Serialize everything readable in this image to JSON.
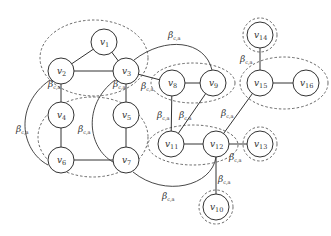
{
  "diagram": {
    "type": "graph",
    "node_prefix": "v",
    "nodes": [
      {
        "id": "v1",
        "sub": "1",
        "x": 104,
        "y": 42
      },
      {
        "id": "v2",
        "sub": "2",
        "x": 61,
        "y": 71
      },
      {
        "id": "v3",
        "sub": "3",
        "x": 126,
        "y": 71
      },
      {
        "id": "v4",
        "sub": "4",
        "x": 61,
        "y": 115
      },
      {
        "id": "v5",
        "sub": "5",
        "x": 126,
        "y": 115
      },
      {
        "id": "v6",
        "sub": "6",
        "x": 61,
        "y": 160
      },
      {
        "id": "v7",
        "sub": "7",
        "x": 126,
        "y": 160
      },
      {
        "id": "v8",
        "sub": "8",
        "x": 172,
        "y": 83
      },
      {
        "id": "v9",
        "sub": "9",
        "x": 213,
        "y": 83
      },
      {
        "id": "v10",
        "sub": "10",
        "x": 216,
        "y": 207
      },
      {
        "id": "v11",
        "sub": "11",
        "x": 171,
        "y": 144
      },
      {
        "id": "v12",
        "sub": "12",
        "x": 216,
        "y": 144
      },
      {
        "id": "v13",
        "sub": "13",
        "x": 260,
        "y": 144
      },
      {
        "id": "v14",
        "sub": "14",
        "x": 260,
        "y": 35
      },
      {
        "id": "v15",
        "sub": "15",
        "x": 260,
        "y": 83
      },
      {
        "id": "v16",
        "sub": "16",
        "x": 306,
        "y": 83
      }
    ],
    "edges": [
      [
        "v1",
        "v2"
      ],
      [
        "v1",
        "v3"
      ],
      [
        "v2",
        "v3"
      ],
      [
        "v2",
        "v4"
      ],
      [
        "v4",
        "v6"
      ],
      [
        "v6",
        "v7"
      ],
      [
        "v3",
        "v5"
      ],
      [
        "v5",
        "v7"
      ],
      [
        "v3",
        "v8"
      ],
      [
        "v8",
        "v9"
      ],
      [
        "v8",
        "v11"
      ],
      [
        "v9",
        "v11"
      ],
      [
        "v11",
        "v12"
      ],
      [
        "v12",
        "v13"
      ],
      [
        "v12",
        "v10"
      ],
      [
        "v12",
        "v15"
      ],
      [
        "v14",
        "v15"
      ],
      [
        "v15",
        "v16"
      ]
    ],
    "groups": [
      {
        "name": "v1-v2-v3 cluster",
        "members": [
          "v1",
          "v2",
          "v3"
        ]
      },
      {
        "name": "v4-v6-v7 cluster",
        "members": [
          "v4",
          "v6",
          "v7",
          "v5"
        ]
      },
      {
        "name": "v8-v9 cluster",
        "members": [
          "v8",
          "v9"
        ]
      },
      {
        "name": "v11-v12 cluster",
        "members": [
          "v11",
          "v12"
        ]
      },
      {
        "name": "v13 cluster",
        "members": [
          "v13"
        ]
      },
      {
        "name": "v10 cluster",
        "members": [
          "v10"
        ]
      },
      {
        "name": "v14 cluster",
        "members": [
          "v14"
        ]
      },
      {
        "name": "v15-v16 cluster",
        "members": [
          "v15",
          "v16"
        ]
      }
    ],
    "edge_label": {
      "symbol": "β",
      "subscript": "c,a"
    },
    "beta_labels": [
      {
        "x": 48,
        "y": 87
      },
      {
        "x": 16,
        "y": 132
      },
      {
        "x": 78,
        "y": 132
      },
      {
        "x": 113,
        "y": 87
      },
      {
        "x": 141,
        "y": 89
      },
      {
        "x": 168,
        "y": 38
      },
      {
        "x": 157,
        "y": 118
      },
      {
        "x": 179,
        "y": 118
      },
      {
        "x": 221,
        "y": 116
      },
      {
        "x": 240,
        "y": 62
      },
      {
        "x": 229,
        "y": 160
      },
      {
        "x": 218,
        "y": 182
      },
      {
        "x": 162,
        "y": 199
      }
    ]
  }
}
